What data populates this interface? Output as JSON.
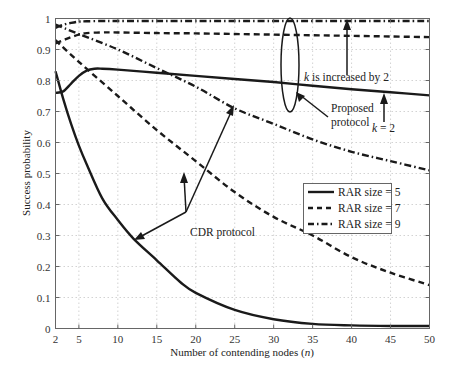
{
  "chart_data": {
    "type": "line",
    "title": "",
    "xlabel": "Number of contending nodes (n)",
    "xlabel_parts": {
      "prefix": "Number of contending nodes (",
      "var": "n",
      "suffix": ")"
    },
    "ylabel": "Success probability",
    "xlim": [
      2,
      50
    ],
    "ylim": [
      0,
      1
    ],
    "x_ticks": [
      2,
      5,
      10,
      15,
      20,
      25,
      30,
      35,
      40,
      45,
      50
    ],
    "y_ticks": [
      0,
      0.1,
      0.2,
      0.3,
      0.4,
      0.5,
      0.6,
      0.7,
      0.8,
      0.9,
      1
    ],
    "y_tick_labels": [
      "0",
      "0.1",
      "0.2",
      "0.3",
      "0.4",
      "0.5",
      "0.6",
      "0.7",
      "0.8",
      "0.9",
      "1"
    ],
    "grid": true,
    "legend_position": "center-right",
    "legend": [
      {
        "label": "RAR size = 5",
        "style": "solid"
      },
      {
        "label": "RAR size = 7",
        "style": "dashed"
      },
      {
        "label": "RAR size = 9",
        "style": "dashdot"
      }
    ],
    "series": [
      {
        "name": "Proposed protocol, RAR size = 5",
        "group": "Proposed protocol",
        "rar_size": 5,
        "style": "solid",
        "x": [
          2,
          3,
          4,
          5,
          6,
          7,
          8,
          10,
          15,
          20,
          25,
          30,
          35,
          40,
          45,
          50
        ],
        "y": [
          0.76,
          0.765,
          0.79,
          0.815,
          0.832,
          0.838,
          0.838,
          0.835,
          0.825,
          0.815,
          0.805,
          0.795,
          0.783,
          0.772,
          0.762,
          0.752
        ]
      },
      {
        "name": "Proposed protocol, RAR size = 7",
        "group": "Proposed protocol",
        "rar_size": 7,
        "style": "dashed",
        "x": [
          2,
          3,
          4,
          5,
          6,
          8,
          10,
          15,
          20,
          25,
          30,
          35,
          40,
          45,
          50
        ],
        "y": [
          0.92,
          0.93,
          0.94,
          0.948,
          0.953,
          0.955,
          0.955,
          0.953,
          0.952,
          0.95,
          0.948,
          0.946,
          0.944,
          0.942,
          0.94
        ]
      },
      {
        "name": "Proposed protocol, RAR size = 9",
        "group": "Proposed protocol",
        "rar_size": 9,
        "style": "dashdot",
        "x": [
          2,
          3,
          4,
          5,
          6,
          8,
          10,
          15,
          20,
          25,
          30,
          35,
          40,
          45,
          50
        ],
        "y": [
          0.97,
          0.98,
          0.986,
          0.99,
          0.991,
          0.992,
          0.992,
          0.992,
          0.992,
          0.992,
          0.992,
          0.992,
          0.992,
          0.992,
          0.992
        ]
      },
      {
        "name": "CDR protocol, RAR size = 5",
        "group": "CDR protocol",
        "rar_size": 5,
        "style": "solid",
        "x": [
          2,
          3,
          4,
          5,
          6,
          8,
          10,
          12,
          15,
          18,
          20,
          25,
          30,
          35,
          40,
          45,
          50
        ],
        "y": [
          0.83,
          0.74,
          0.66,
          0.59,
          0.53,
          0.42,
          0.35,
          0.29,
          0.22,
          0.15,
          0.115,
          0.06,
          0.03,
          0.015,
          0.01,
          0.008,
          0.008
        ]
      },
      {
        "name": "CDR protocol, RAR size = 7",
        "group": "CDR protocol",
        "rar_size": 7,
        "style": "dashed",
        "x": [
          2,
          5,
          10,
          15,
          20,
          25,
          30,
          35,
          40,
          45,
          50
        ],
        "y": [
          0.93,
          0.86,
          0.75,
          0.64,
          0.54,
          0.44,
          0.36,
          0.3,
          0.23,
          0.18,
          0.14
        ]
      },
      {
        "name": "CDR protocol, RAR size = 9",
        "group": "CDR protocol",
        "rar_size": 9,
        "style": "dashdot",
        "x": [
          2,
          5,
          10,
          15,
          20,
          25,
          30,
          35,
          40,
          45,
          50
        ],
        "y": [
          0.98,
          0.95,
          0.9,
          0.84,
          0.78,
          0.71,
          0.66,
          0.61,
          0.57,
          0.54,
          0.51
        ]
      }
    ],
    "annotations": [
      {
        "text_var": "k",
        "text": " is increased by 2",
        "full": "k is increased by 2"
      },
      {
        "text": "Proposed",
        "text2": "protocol",
        "full": "Proposed protocol"
      },
      {
        "text": "k = 2",
        "text_var": "k",
        "text_rest": " = 2"
      },
      {
        "text": "CDR protocol"
      }
    ]
  }
}
